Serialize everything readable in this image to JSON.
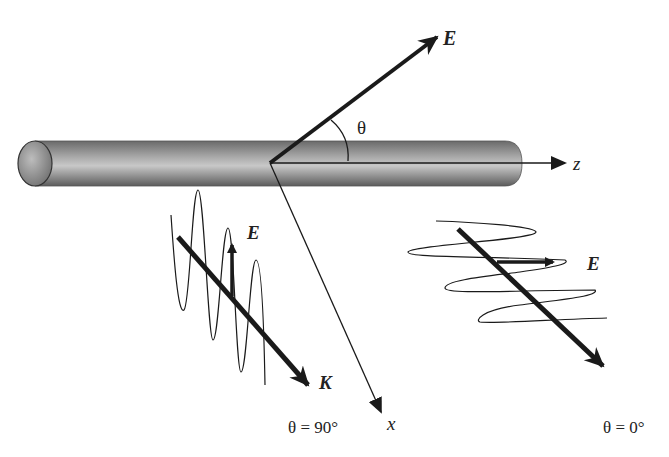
{
  "diagram": {
    "labels": {
      "e_main": "E",
      "theta": "θ",
      "z_axis": "z",
      "x_axis": "x",
      "e_left": "E",
      "k_left": "K",
      "theta_90": "θ = 90°",
      "e_right": "E",
      "theta_0": "θ = 0°"
    },
    "colors": {
      "rod_dark": "#5a5a5a",
      "rod_light": "#c4c4c4",
      "ink": "#1a1a1a",
      "background": "#ffffff"
    }
  }
}
